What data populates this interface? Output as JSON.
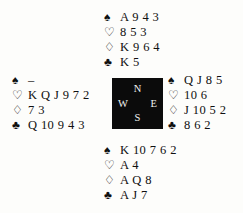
{
  "diagram": {
    "type": "bridge-hand-diagram",
    "suit_symbols": {
      "spade": "♠",
      "heart": "♡",
      "diamond": "♢",
      "club": "♣"
    },
    "compass": {
      "north": "N",
      "west": "W",
      "east": "E",
      "south": "S",
      "box_color": "#0b0b0b",
      "label_color": "#f2f2f0"
    },
    "hands": {
      "north": {
        "spades": "A 9 4 3",
        "hearts": "8 5 3",
        "diamonds": "K 9 6 4",
        "clubs": "K 5"
      },
      "west": {
        "spades": "–",
        "hearts": "K Q J 9 7 2",
        "diamonds": "7 3",
        "clubs": "Q 10 9 4 3"
      },
      "east": {
        "spades": "Q J 8 5",
        "hearts": "10 6",
        "diamonds": "J 10 5 2",
        "clubs": "8 6 2"
      },
      "south": {
        "spades": "K 10 7 6 2",
        "hearts": "A 4",
        "diamonds": "A Q 8",
        "clubs": "A J 7"
      }
    }
  }
}
